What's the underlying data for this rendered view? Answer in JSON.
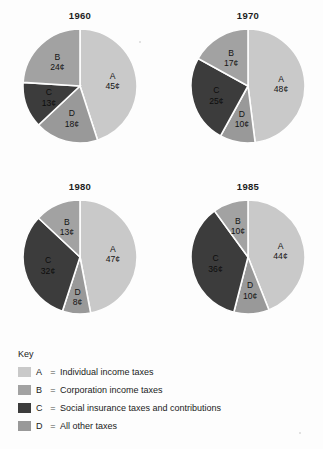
{
  "figure": {
    "background_color": "#fdfdfd",
    "unit_symbol": "¢"
  },
  "chart_data": {
    "type": "pie",
    "title": "",
    "categories": [
      "A",
      "B",
      "C",
      "D"
    ],
    "category_labels": [
      "Individual income taxes",
      "Corporation income taxes",
      "Social insurance taxes and contributions",
      "All other taxes"
    ],
    "colors": [
      "#c9c9c9",
      "#a2a2a2",
      "#3c3c3c",
      "#999999"
    ],
    "value_unit": "¢",
    "charts": [
      {
        "title": "1960",
        "slices": [
          {
            "key": "A",
            "value": 45,
            "label": "45¢",
            "color": "#c9c9c9"
          },
          {
            "key": "D",
            "value": 18,
            "label": "18¢",
            "color": "#999999"
          },
          {
            "key": "C",
            "value": 13,
            "label": "13¢",
            "color": "#3c3c3c"
          },
          {
            "key": "B",
            "value": 24,
            "label": "24¢",
            "color": "#a2a2a2"
          }
        ]
      },
      {
        "title": "1970",
        "slices": [
          {
            "key": "A",
            "value": 48,
            "label": "48¢",
            "color": "#c9c9c9"
          },
          {
            "key": "D",
            "value": 10,
            "label": "10¢",
            "color": "#999999"
          },
          {
            "key": "C",
            "value": 25,
            "label": "25¢",
            "color": "#3c3c3c"
          },
          {
            "key": "B",
            "value": 17,
            "label": "17¢",
            "color": "#a2a2a2"
          }
        ]
      },
      {
        "title": "1980",
        "slices": [
          {
            "key": "A",
            "value": 47,
            "label": "47¢",
            "color": "#c9c9c9"
          },
          {
            "key": "D",
            "value": 8,
            "label": "8¢",
            "color": "#999999"
          },
          {
            "key": "C",
            "value": 32,
            "label": "32¢",
            "color": "#3c3c3c"
          },
          {
            "key": "B",
            "value": 13,
            "label": "13¢",
            "color": "#a2a2a2"
          }
        ]
      },
      {
        "title": "1985",
        "slices": [
          {
            "key": "A",
            "value": 44,
            "label": "44¢",
            "color": "#c9c9c9"
          },
          {
            "key": "D",
            "value": 10,
            "label": "10¢",
            "color": "#999999"
          },
          {
            "key": "C",
            "value": 36,
            "label": "36¢",
            "color": "#3c3c3c"
          },
          {
            "key": "B",
            "value": 10,
            "label": "10¢",
            "color": "#a2a2a2"
          }
        ]
      }
    ],
    "legend": {
      "heading": "Key",
      "position": "bottom-left",
      "equals_sign": "=",
      "entries": [
        {
          "key": "A",
          "label": "Individual income taxes",
          "color": "#c9c9c9"
        },
        {
          "key": "B",
          "label": "Corporation income taxes",
          "color": "#a2a2a2"
        },
        {
          "key": "C",
          "label": "Social insurance taxes and contributions",
          "color": "#3c3c3c"
        },
        {
          "key": "D",
          "label": "All other taxes",
          "color": "#999999"
        }
      ]
    }
  }
}
